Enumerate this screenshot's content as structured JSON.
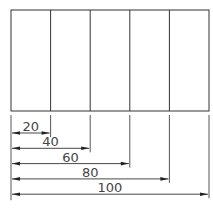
{
  "diagram": {
    "type": "dimensioned-rectangle",
    "strip_count": 5,
    "dimensions": [
      {
        "label": "20",
        "value": 20
      },
      {
        "label": "40",
        "value": 40
      },
      {
        "label": "60",
        "value": 60
      },
      {
        "label": "80",
        "value": 80
      },
      {
        "label": "100",
        "value": 100
      }
    ],
    "total": 100,
    "colors": {
      "line": "#333333",
      "text": "#444444",
      "background": "#ffffff"
    }
  }
}
